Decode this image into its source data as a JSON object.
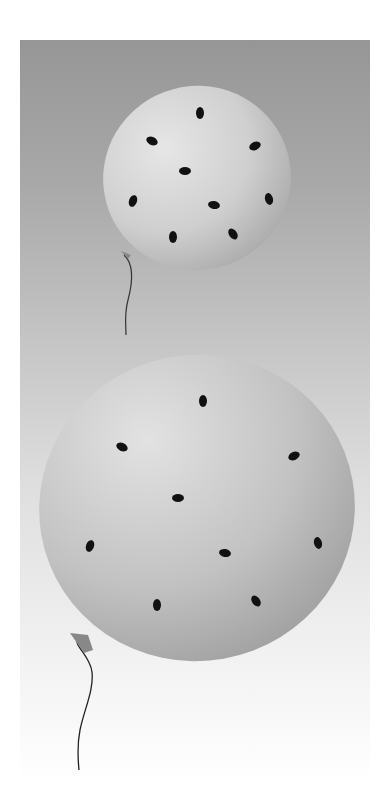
{
  "image": {
    "description": "Illustration of two balloons covered with black bugs on a gray-to-white gradient background",
    "colors": {
      "background_top": "#969696",
      "background_bottom": "#ffffff",
      "balloon_light": "#e4e4e4",
      "balloon_dark": "#a8a8a8",
      "bug": "#111111",
      "string": "#333333"
    },
    "balloons": [
      {
        "name": "small-balloon",
        "cx": 197,
        "cy": 178,
        "rx": 94,
        "ry": 92,
        "bug_count": 9
      },
      {
        "name": "large-balloon",
        "cx": 197,
        "cy": 508,
        "rx": 158,
        "ry": 153,
        "bug_count": 9
      }
    ]
  }
}
